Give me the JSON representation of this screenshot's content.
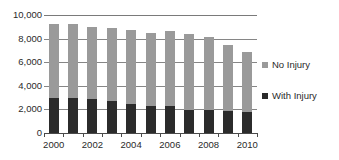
{
  "chart_data": {
    "type": "bar",
    "subtype": "stacked-column",
    "title": "",
    "subtitle": "",
    "xlabel": "",
    "ylabel": "",
    "categories": [
      "2000",
      "2001",
      "2002",
      "2003",
      "2004",
      "2005",
      "2006",
      "2007",
      "2008",
      "2009",
      "2010"
    ],
    "x_tick_labels": [
      "2000",
      "",
      "2002",
      "",
      "2004",
      "",
      "2006",
      "",
      "2008",
      "",
      "2010"
    ],
    "y_tick_labels": [
      "0",
      "2,000",
      "4,000",
      "6,000",
      "8,000",
      "10,000"
    ],
    "y_ticks": [
      0,
      2000,
      4000,
      6000,
      8000,
      10000
    ],
    "ylim": [
      0,
      10000
    ],
    "grid": true,
    "grid_axis": "y",
    "legend_position": "right",
    "series": [
      {
        "name": "With Injury",
        "color": "#2b2b2b",
        "values": [
          2950,
          2930,
          2850,
          2750,
          2450,
          2250,
          2300,
          1980,
          1980,
          1830,
          1760
        ]
      },
      {
        "name": "No Injury",
        "color": "#9a9a9a",
        "values": [
          6300,
          6270,
          6100,
          6150,
          6300,
          6200,
          6350,
          6420,
          6120,
          5620,
          5140
        ]
      }
    ],
    "totals": [
      9250,
      9200,
      8950,
      8900,
      8750,
      8450,
      8650,
      8400,
      8100,
      7450,
      6900
    ]
  },
  "legend": {
    "items": [
      {
        "label": "No Injury",
        "color": "#9a9a9a"
      },
      {
        "label": "With Injury",
        "color": "#2b2b2b"
      }
    ]
  },
  "colors": {
    "no_injury": "#9a9a9a",
    "with_injury": "#2b2b2b",
    "gridline": "#868686",
    "axis": "#4a4a4a",
    "text": "#2a2a2a",
    "background": "#ffffff"
  }
}
